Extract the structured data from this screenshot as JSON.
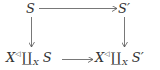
{
  "diagram": {
    "type": "commutative-square",
    "nodes": {
      "top_left": {
        "base": "S",
        "prime": ""
      },
      "top_right": {
        "base": "S",
        "prime": "′"
      },
      "bottom_left": {
        "x": "X",
        "sup": "◁",
        "coprod": "∐",
        "sub": "X",
        "obj": "S",
        "prime": ""
      },
      "bottom_right": {
        "x": "X",
        "sup": "◁",
        "coprod": "∐",
        "sub": "X",
        "obj": "S",
        "prime": "′"
      }
    },
    "arrows": [
      {
        "from": "top_left",
        "to": "top_right"
      },
      {
        "from": "top_left",
        "to": "bottom_left"
      },
      {
        "from": "top_right",
        "to": "bottom_right"
      },
      {
        "from": "bottom_left",
        "to": "bottom_right"
      }
    ],
    "colors": {
      "ink": "#333333",
      "arrow": "#555555"
    }
  }
}
